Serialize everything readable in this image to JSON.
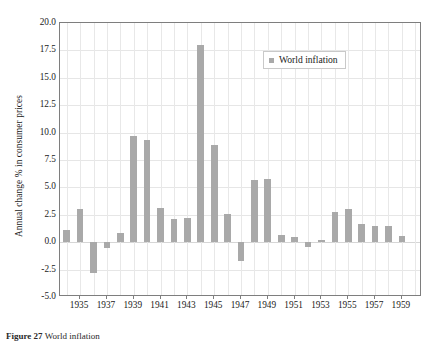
{
  "chart_data": {
    "type": "bar",
    "title": "",
    "xlabel": "",
    "ylabel": "Annual change % in consumer prices",
    "ylim": [
      -5.0,
      20.0
    ],
    "yticks": [
      -5.0,
      -2.5,
      0.0,
      2.5,
      5.0,
      7.5,
      10.0,
      12.5,
      15.0,
      17.5,
      20.0
    ],
    "ytick_labels": [
      "-5.0",
      "-2.5",
      "0.0",
      "2.5",
      "5.0",
      "7.5",
      "10.0",
      "12.5",
      "15.0",
      "17.5",
      "20.0"
    ],
    "xlim": [
      1933.5,
      1960.5
    ],
    "xticks": [
      1935,
      1937,
      1939,
      1941,
      1943,
      1945,
      1947,
      1949,
      1951,
      1953,
      1955,
      1957,
      1959
    ],
    "xtick_labels": [
      "1935",
      "1937",
      "1939",
      "1941",
      "1943",
      "1945",
      "1947",
      "1949",
      "1951",
      "1953",
      "1955",
      "1957",
      "1959"
    ],
    "grid": true,
    "legend_position": "upper center",
    "bar_color": "#a9a9a9",
    "categories": [
      1934,
      1935,
      1936,
      1937,
      1938,
      1939,
      1940,
      1941,
      1942,
      1943,
      1944,
      1945,
      1946,
      1947,
      1948,
      1949,
      1950,
      1951,
      1952,
      1953,
      1954,
      1955,
      1956,
      1957,
      1958,
      1959
    ],
    "series": [
      {
        "name": "World inflation",
        "values": [
          1.1,
          3.0,
          -2.8,
          -0.5,
          0.8,
          9.7,
          9.3,
          3.1,
          2.1,
          2.2,
          18.0,
          8.9,
          2.6,
          -1.7,
          5.7,
          5.8,
          0.7,
          0.5,
          -0.4,
          0.2,
          2.8,
          3.0,
          1.7,
          1.5,
          1.5,
          0.6
        ]
      }
    ]
  },
  "legend": {
    "entries": [
      {
        "label": "World inflation",
        "color": "#a9a9a9",
        "marker": "square"
      }
    ]
  },
  "caption": {
    "figure_number": "Figure 27",
    "text": "World inflation"
  }
}
